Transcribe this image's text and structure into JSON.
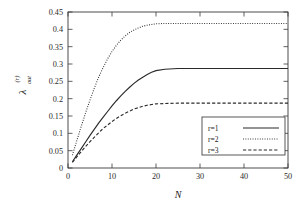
{
  "chart_data": {
    "type": "line",
    "title": "",
    "xlabel": "N",
    "ylabel": "λ",
    "ylabel_superscript": "(r)",
    "ylabel_subscript": "out",
    "xlim": [
      0,
      50
    ],
    "ylim": [
      0,
      0.45
    ],
    "xticks": [
      0,
      10,
      20,
      30,
      40,
      50
    ],
    "xtick_labels": [
      "0",
      "10",
      "20",
      "30",
      "40",
      "50"
    ],
    "yticks": [
      0,
      0.05,
      0.1,
      0.15,
      0.2,
      0.25,
      0.3,
      0.35,
      0.4,
      0.45
    ],
    "ytick_labels": [
      "0",
      "0.05",
      "0.1",
      "0.15",
      "0.2",
      "0.25",
      "0.3",
      "0.35",
      "0.4",
      "0.45"
    ],
    "grid": false,
    "legend_position": "lower right",
    "x": [
      1,
      2,
      3,
      4,
      5,
      6,
      7,
      8,
      9,
      10,
      11,
      12,
      13,
      14,
      15,
      16,
      17,
      18,
      19,
      20,
      22,
      25,
      28,
      30,
      35,
      40,
      45,
      50
    ],
    "series": [
      {
        "name": "r=1",
        "label": "r=1",
        "style": "solid",
        "color": "#2a2a2a",
        "plateau": 0.287,
        "values": [
          0.018,
          0.037,
          0.056,
          0.075,
          0.094,
          0.112,
          0.13,
          0.147,
          0.163,
          0.179,
          0.194,
          0.208,
          0.221,
          0.233,
          0.244,
          0.254,
          0.262,
          0.27,
          0.276,
          0.281,
          0.285,
          0.287,
          0.287,
          0.287,
          0.287,
          0.287,
          0.287,
          0.287
        ]
      },
      {
        "name": "r=2",
        "label": "r=2",
        "style": "dotted",
        "color": "#2a2a2a",
        "plateau": 0.417,
        "values": [
          0.037,
          0.079,
          0.12,
          0.159,
          0.196,
          0.231,
          0.263,
          0.29,
          0.315,
          0.336,
          0.354,
          0.369,
          0.381,
          0.391,
          0.398,
          0.404,
          0.409,
          0.412,
          0.414,
          0.416,
          0.417,
          0.417,
          0.417,
          0.417,
          0.417,
          0.417,
          0.417,
          0.417
        ]
      },
      {
        "name": "r=3",
        "label": "r=3",
        "style": "dashed",
        "color": "#2a2a2a",
        "plateau": 0.187,
        "values": [
          0.016,
          0.032,
          0.047,
          0.062,
          0.076,
          0.089,
          0.102,
          0.114,
          0.124,
          0.134,
          0.143,
          0.151,
          0.158,
          0.164,
          0.17,
          0.174,
          0.178,
          0.181,
          0.183,
          0.185,
          0.186,
          0.187,
          0.187,
          0.187,
          0.187,
          0.187,
          0.187,
          0.187
        ]
      }
    ]
  },
  "legend": {
    "items": [
      {
        "label": "r=1"
      },
      {
        "label": "r=2"
      },
      {
        "label": "r=3"
      }
    ]
  }
}
